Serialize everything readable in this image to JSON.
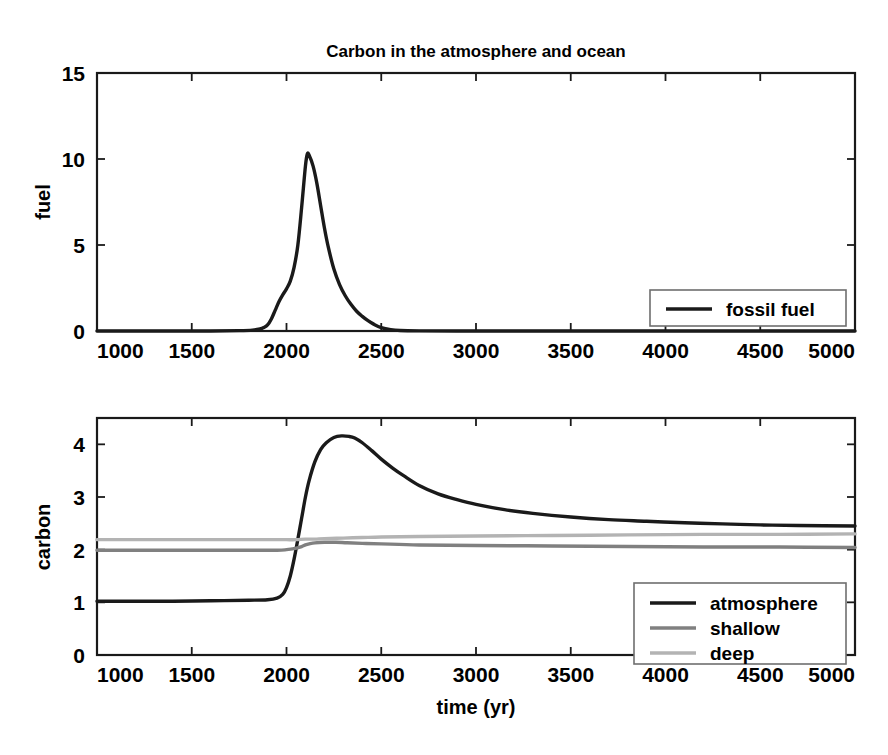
{
  "figure": {
    "title": "Carbon in the atmosphere and ocean",
    "width": 888,
    "height": 755,
    "background": "#ffffff"
  },
  "colors": {
    "axis": "#1a1a1a",
    "atmosphere": "#1a1a1a",
    "shallow": "#808080",
    "deep": "#b3b3b3",
    "fossil_fuel": "#1a1a1a",
    "legend_border": "#6e6e6e"
  },
  "chart_data": [
    {
      "type": "line",
      "id": "fuel-panel",
      "title": "Carbon in the atmosphere and ocean",
      "xlabel": "",
      "ylabel": "fuel",
      "xlim": [
        1000,
        5000
      ],
      "ylim": [
        0,
        15
      ],
      "xticks": [
        1000,
        1500,
        2000,
        2500,
        3000,
        3500,
        4000,
        4500,
        5000
      ],
      "yticks": [
        0,
        5,
        10,
        15
      ],
      "xticklabels": [
        "1000",
        "1500",
        "2000",
        "2500",
        "3000",
        "3500",
        "4000",
        "4500",
        "5000"
      ],
      "yticklabels": [
        "0",
        "5",
        "10",
        "15"
      ],
      "grid": false,
      "legend_position": "lower right",
      "series": [
        {
          "name": "fossil fuel",
          "color": "#1a1a1a",
          "width": 3.4,
          "x": [
            1000,
            1200,
            1400,
            1600,
            1750,
            1820,
            1860,
            1880,
            1900,
            1920,
            1940,
            1960,
            1980,
            2000,
            2020,
            2040,
            2060,
            2080,
            2100,
            2110,
            2120,
            2140,
            2160,
            2180,
            2200,
            2220,
            2250,
            2280,
            2310,
            2340,
            2370,
            2400,
            2430,
            2460,
            2500,
            2550,
            2600,
            2700,
            2900,
            3200,
            3600,
            4000,
            4500,
            5000
          ],
          "values": [
            0,
            0,
            0,
            0,
            0.02,
            0.05,
            0.12,
            0.2,
            0.35,
            0.7,
            1.2,
            1.7,
            2.1,
            2.45,
            2.9,
            3.7,
            5.0,
            7.2,
            9.6,
            10.3,
            10.2,
            9.6,
            8.6,
            7.3,
            6.0,
            4.9,
            3.6,
            2.7,
            2.05,
            1.55,
            1.15,
            0.85,
            0.6,
            0.4,
            0.2,
            0.08,
            0.03,
            0.01,
            0,
            0,
            0,
            0,
            0,
            0
          ]
        }
      ]
    },
    {
      "type": "line",
      "id": "carbon-panel",
      "title": "",
      "xlabel": "time (yr)",
      "ylabel": "carbon",
      "xlim": [
        1000,
        5000
      ],
      "ylim": [
        0,
        4.5
      ],
      "xticks": [
        1000,
        1500,
        2000,
        2500,
        3000,
        3500,
        4000,
        4500,
        5000
      ],
      "yticks": [
        0,
        1,
        2,
        3,
        4
      ],
      "xticklabels": [
        "1000",
        "1500",
        "2000",
        "2500",
        "3000",
        "3500",
        "4000",
        "4500",
        "5000"
      ],
      "yticklabels": [
        "0",
        "1",
        "2",
        "3",
        "4"
      ],
      "grid": false,
      "legend_position": "lower right",
      "series": [
        {
          "name": "atmosphere",
          "color": "#1a1a1a",
          "width": 3.4,
          "x": [
            1000,
            1200,
            1400,
            1600,
            1800,
            1900,
            1950,
            1980,
            2000,
            2020,
            2040,
            2060,
            2080,
            2100,
            2120,
            2150,
            2180,
            2210,
            2250,
            2290,
            2330,
            2360,
            2400,
            2450,
            2500,
            2560,
            2620,
            2700,
            2800,
            2900,
            3000,
            3150,
            3300,
            3500,
            3700,
            3900,
            4100,
            4300,
            4500,
            4700,
            5000
          ],
          "values": [
            1.02,
            1.02,
            1.02,
            1.03,
            1.04,
            1.05,
            1.08,
            1.15,
            1.28,
            1.5,
            1.82,
            2.2,
            2.6,
            3.0,
            3.32,
            3.67,
            3.9,
            4.03,
            4.13,
            4.16,
            4.15,
            4.12,
            4.03,
            3.88,
            3.72,
            3.55,
            3.4,
            3.22,
            3.06,
            2.95,
            2.86,
            2.76,
            2.69,
            2.62,
            2.57,
            2.54,
            2.51,
            2.49,
            2.47,
            2.46,
            2.45
          ]
        },
        {
          "name": "shallow",
          "color": "#808080",
          "width": 3.4,
          "x": [
            1000,
            1400,
            1800,
            1950,
            2000,
            2040,
            2080,
            2100,
            2120,
            2150,
            2200,
            2260,
            2320,
            2400,
            2500,
            2700,
            3000,
            3400,
            3800,
            4200,
            4600,
            5000
          ],
          "values": [
            1.99,
            1.99,
            1.99,
            1.99,
            2.0,
            2.02,
            2.06,
            2.09,
            2.11,
            2.13,
            2.14,
            2.14,
            2.13,
            2.12,
            2.11,
            2.09,
            2.08,
            2.07,
            2.06,
            2.05,
            2.05,
            2.04
          ]
        },
        {
          "name": "deep",
          "color": "#b3b3b3",
          "width": 3.4,
          "x": [
            1000,
            1400,
            1800,
            1950,
            2000,
            2050,
            2100,
            2150,
            2200,
            2300,
            2400,
            2500,
            2700,
            3000,
            3400,
            3800,
            4200,
            4600,
            5000
          ],
          "values": [
            2.19,
            2.19,
            2.19,
            2.19,
            2.19,
            2.19,
            2.2,
            2.2,
            2.21,
            2.22,
            2.23,
            2.24,
            2.25,
            2.26,
            2.27,
            2.28,
            2.29,
            2.29,
            2.3
          ]
        }
      ]
    }
  ],
  "panels": {
    "top": {
      "ylabel": "fuel",
      "legend": [
        {
          "label": "fossil fuel",
          "color": "#1a1a1a"
        }
      ]
    },
    "bottom": {
      "ylabel": "carbon",
      "xlabel": "time (yr)",
      "legend": [
        {
          "label": "atmosphere",
          "color": "#1a1a1a"
        },
        {
          "label": "shallow",
          "color": "#808080"
        },
        {
          "label": "deep",
          "color": "#b3b3b3"
        }
      ]
    }
  }
}
